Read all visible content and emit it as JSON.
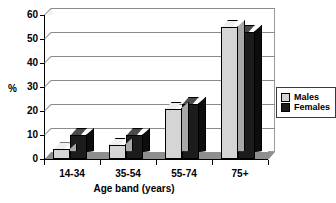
{
  "chart_data": {
    "type": "bar",
    "title": "",
    "subtitle": "",
    "xlabel": "Age band (years)",
    "ylabel": "%",
    "categories": [
      "14-34",
      "35-54",
      "55-74",
      "75+"
    ],
    "series": [
      {
        "name": "Males",
        "color": "#d5d5d5",
        "values": [
          4,
          6,
          21,
          55
        ]
      },
      {
        "name": "Females",
        "color": "#1c1c1c",
        "values": [
          10,
          10,
          23,
          53
        ]
      }
    ],
    "ylim": [
      0,
      60
    ],
    "ytick_step": 10,
    "yticks": [
      0,
      10,
      20,
      30,
      40,
      50,
      60
    ],
    "ytick_labels": [
      "0",
      "10",
      "20",
      "30",
      "40",
      "50",
      "60"
    ],
    "grid": true,
    "grid_axis": "y",
    "legend_position": "right",
    "style": "3d-clustered-column",
    "palette": {
      "males_front": "#d5d5d5",
      "males_top": "#efefef",
      "males_side": "#a8a8a8",
      "females_front": "#1c1c1c",
      "females_top": "#4a4a4a",
      "females_side": "#0d0d0d",
      "gridline": "#8c8c8c",
      "axis": "#000000",
      "floor": "#8f8f8f",
      "background": "#ffffff"
    }
  },
  "legend": {
    "items": [
      {
        "label": "Males"
      },
      {
        "label": "Females"
      }
    ]
  }
}
